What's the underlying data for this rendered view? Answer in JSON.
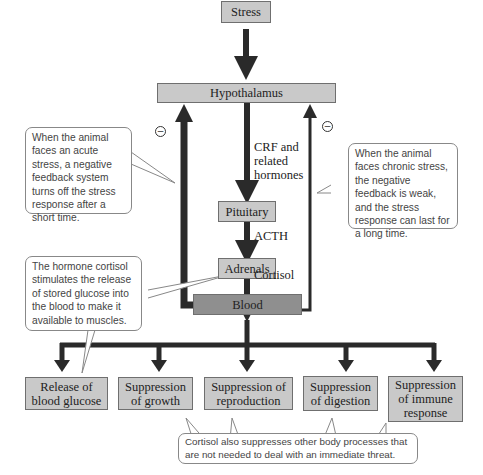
{
  "diagram": {
    "nodes": {
      "stress": "Stress",
      "hypothalamus": "Hypothalamus",
      "pituitary": "Pituitary",
      "adrenals": "Adrenals",
      "blood": "Blood"
    },
    "edge_labels": {
      "crf": "CRF and related hormones",
      "acth": "ACTH",
      "cortisol": "Cortisol"
    },
    "feedback_symbol": "⊖",
    "outcomes": [
      "Release of blood glucose",
      "Suppression of growth",
      "Suppression of reproduction",
      "Suppression of digestion",
      "Suppression of immune response"
    ],
    "callouts": {
      "acute": "When the animal faces an acute stress, a negative feedback system turns off the stress response after a short time.",
      "chronic": "When the animal faces chronic stress, the negative feedback is weak, and the stress response can last for a long time.",
      "glucose": "The hormone cortisol stimulates the release of stored glucose into the blood to make it available to muscles.",
      "suppression": "Cortisol also suppresses other body processes that are not needed to deal with an immediate threat."
    },
    "colors": {
      "box_fill": "#c9c9c9",
      "blood_fill": "#8f8f8f",
      "arrow": "#2a2a2a",
      "callout_border": "#888888"
    }
  }
}
